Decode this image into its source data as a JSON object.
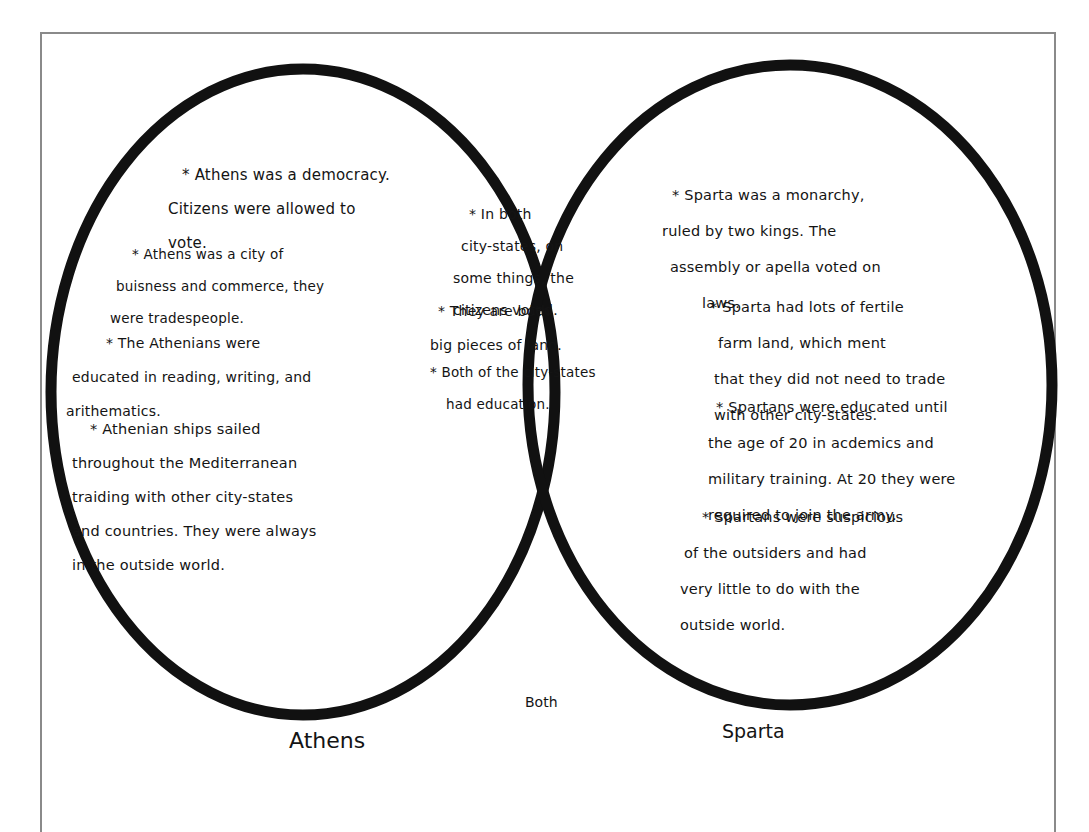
{
  "diagram": {
    "type": "venn",
    "colors": {
      "ink": "#111111",
      "frame": "#8a8a8a",
      "paper": "#ffffff"
    },
    "labels": {
      "left": "Athens",
      "right": "Sparta",
      "center": "Both"
    },
    "athens": {
      "notes": [
        {
          "lines": [
            "* Athens was a democracy.",
            "Citizens were allowed to",
            "vote."
          ]
        },
        {
          "lines": [
            "* Athens was a city of",
            "buisness and commerce, they",
            "were tradespeople."
          ]
        },
        {
          "lines": [
            "* The Athenians were",
            "educated in reading, writing, and",
            "arithematics."
          ]
        },
        {
          "lines": [
            "* Athenian ships sailed",
            "throughout the Mediterranean",
            "traiding with other city-states",
            "and countries. They were always",
            "in the outside world."
          ]
        }
      ]
    },
    "both": {
      "notes": [
        {
          "lines": [
            "* In both",
            "city-states, on",
            "some things, the",
            "citizens voted."
          ]
        },
        {
          "lines": [
            "* They are both",
            "big pieces of land."
          ]
        },
        {
          "lines": [
            "* Both of the city-states",
            "had education."
          ]
        }
      ]
    },
    "sparta": {
      "notes": [
        {
          "lines": [
            "* Sparta was a monarchy,",
            "ruled by two kings. The",
            "assembly or apella voted on",
            "laws."
          ]
        },
        {
          "lines": [
            "* Sparta had lots of fertile",
            "farm land, which ment",
            "that they did not need to trade",
            "with other city-states."
          ]
        },
        {
          "lines": [
            "* Spartans were educated until",
            "the age of 20 in acdemics and",
            "military training. At 20 they were",
            "required to join the army."
          ]
        },
        {
          "lines": [
            "* Spartans were suspicious",
            "of the outsiders and had",
            "very little to do with the",
            "outside world."
          ]
        }
      ]
    }
  }
}
